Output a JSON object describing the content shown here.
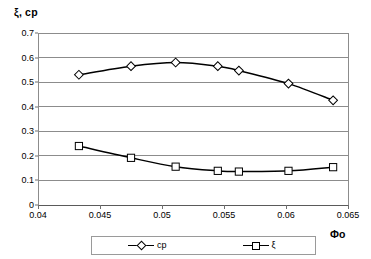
{
  "chart_data": {
    "type": "line",
    "title": "",
    "xlabel": "Фо",
    "ylabel": "ξ, ср",
    "xlim": [
      0.04,
      0.065
    ],
    "ylim": [
      0.0,
      0.7
    ],
    "xticks": [
      "0.04",
      "0.045",
      "0.05",
      "0.055",
      "0.06",
      "0.065"
    ],
    "xtick_values": [
      0.04,
      0.045,
      0.05,
      0.055,
      0.06,
      0.065
    ],
    "yticks": [
      "0",
      "0.1",
      "0.2",
      "0.3",
      "0.4",
      "0.5",
      "0.6",
      "0.7"
    ],
    "ytick_values": [
      0,
      0.1,
      0.2,
      0.3,
      0.4,
      0.5,
      0.6,
      0.7
    ],
    "grid": "horizontal",
    "legend_position": "bottom",
    "x": [
      0.0433,
      0.0475,
      0.0511,
      0.0545,
      0.0562,
      0.0602,
      0.0638
    ],
    "series": [
      {
        "name": "ср",
        "marker": "diamond",
        "color": "#000000",
        "values": [
          0.53,
          0.565,
          0.58,
          0.565,
          0.547,
          0.494,
          0.426
        ]
      },
      {
        "name": "ξ",
        "marker": "square",
        "color": "#000000",
        "values": [
          0.24,
          0.192,
          0.156,
          0.139,
          0.136,
          0.139,
          0.154
        ]
      }
    ]
  },
  "legend": {
    "entries": [
      {
        "label": "ср"
      },
      {
        "label": "ξ"
      }
    ]
  },
  "axes": {
    "y_axis_title": "ξ, ср",
    "x_axis_title": "Фо"
  }
}
